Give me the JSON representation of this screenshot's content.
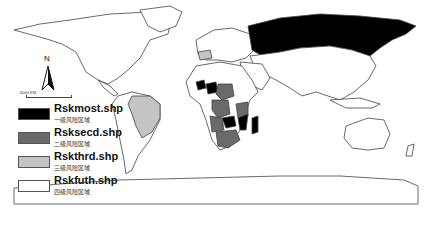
{
  "map": {
    "title": "",
    "colors": {
      "level1": "#000000",
      "level2": "#6a6a6a",
      "level3": "#c4c4c4",
      "level4": "#ffffff",
      "outline": "#444444"
    }
  },
  "north_arrow": {
    "label": "N"
  },
  "scale": {
    "label": "6000 KM"
  },
  "legend": {
    "items": [
      {
        "name": "Rskmost.shp",
        "sub": "一级风险区域",
        "color": "#000000"
      },
      {
        "name": "Rsksecd.shp",
        "sub": "二级风险区域",
        "color": "#6a6a6a"
      },
      {
        "name": "Rskthrd.shp",
        "sub": "三级风险区域",
        "color": "#c4c4c4"
      },
      {
        "name": "Rskfuth.shp",
        "sub": "四级风险区域",
        "color": "#ffffff"
      }
    ]
  }
}
